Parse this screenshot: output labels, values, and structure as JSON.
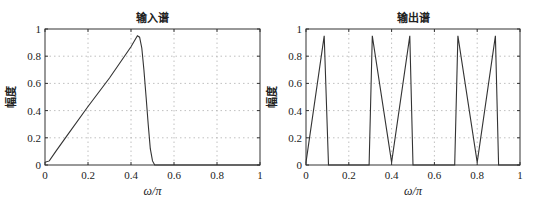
{
  "chart_data": [
    {
      "type": "line",
      "title": "输入谱",
      "xlabel": "ω/π",
      "ylabel": "幅度",
      "xlim": [
        0,
        1
      ],
      "ylim": [
        0,
        1
      ],
      "xticks": [
        "0",
        "0.2",
        "0.4",
        "0.6",
        "0.8",
        "1"
      ],
      "yticks": [
        "0",
        "0.2",
        "0.4",
        "0.6",
        "0.8",
        "1"
      ],
      "grid": true,
      "series": [
        {
          "name": "input",
          "x": [
            0,
            0.02,
            0.05,
            0.1,
            0.2,
            0.3,
            0.4,
            0.43,
            0.44,
            0.45,
            0.46,
            0.47,
            0.48,
            0.49,
            0.5,
            0.51,
            0.52,
            1.0
          ],
          "y": [
            0.02,
            0.03,
            0.1,
            0.21,
            0.43,
            0.64,
            0.87,
            0.95,
            0.94,
            0.86,
            0.7,
            0.5,
            0.3,
            0.12,
            0.03,
            0.0,
            0.0,
            0.0
          ]
        }
      ]
    },
    {
      "type": "line",
      "title": "输出谱",
      "xlabel": "ω/π",
      "ylabel": "幅度",
      "xlim": [
        0,
        1
      ],
      "ylim": [
        0,
        1
      ],
      "xticks": [
        "0",
        "0.2",
        "0.4",
        "0.6",
        "0.8",
        "1"
      ],
      "yticks": [
        "0",
        "0.2",
        "0.4",
        "0.6",
        "0.8",
        "1"
      ],
      "grid": true,
      "series": [
        {
          "name": "output",
          "x": [
            0,
            0.085,
            0.105,
            0.295,
            0.31,
            0.4,
            0.485,
            0.5,
            0.695,
            0.71,
            0.8,
            0.885,
            0.9,
            1.0
          ],
          "y": [
            0.02,
            0.95,
            0.0,
            0.0,
            0.95,
            0.02,
            0.95,
            0.0,
            0.0,
            0.95,
            0.02,
            0.95,
            0.0,
            0.0
          ]
        }
      ]
    }
  ]
}
